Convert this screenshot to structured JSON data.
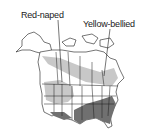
{
  "map": {
    "title": "Sapsucker ranges",
    "labels": {
      "red_naped": "Red-naped",
      "yellow_bellied": "Yellow-bellied"
    },
    "colors": {
      "land": "#ffffff",
      "breeding_range": "#c8c8c8",
      "winter_range": "#707070",
      "border": "#1a1a1a"
    }
  }
}
